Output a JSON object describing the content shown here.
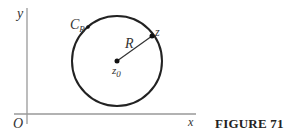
{
  "figure": {
    "caption": "FIGURE 71",
    "labels": {
      "y_axis": "y",
      "x_axis": "x",
      "origin": "O",
      "circle": "C",
      "circle_sub": "R",
      "radius": "R",
      "point": "z",
      "center": "z",
      "center_sub": "0"
    },
    "colors": {
      "axis": "#999999",
      "circle": "#222222",
      "text": "#333333"
    }
  }
}
